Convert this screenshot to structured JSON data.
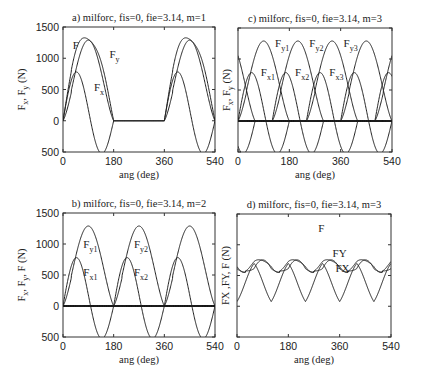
{
  "chart_data": [
    {
      "id": "a",
      "type": "line",
      "title": "a) milforc, fis=0, fie=3.14, m=1",
      "xlabel": "ang (deg)",
      "ylabel": "F_x, F_y (N)",
      "xlim": [
        0,
        540
      ],
      "ylim": [
        -500,
        1500
      ],
      "xticks": [
        0,
        180,
        360,
        540
      ],
      "yticks": [
        1500,
        1000,
        500,
        0,
        -500
      ],
      "ytick_labels": [
        "1500",
        "1000",
        "500",
        "0",
        "500"
      ],
      "show_yticklabels": true,
      "teeth": 1,
      "period_deg": 360,
      "engage_deg": 180,
      "annotations": [
        {
          "text": "F",
          "sub": "",
          "x": 35,
          "y": 1150
        },
        {
          "text": "F",
          "sub": "y",
          "x": 165,
          "y": 1000
        },
        {
          "text": "F",
          "sub": "x",
          "x": 110,
          "y": 480
        }
      ],
      "series": [
        {
          "name": "F",
          "peak": 1300,
          "peak_deg": 103
        },
        {
          "name": "Fy",
          "peak": 1290,
          "peak_deg": 108
        },
        {
          "name": "Fx",
          "peak": 830,
          "peak_deg": 53,
          "min": -470,
          "min_deg": 142
        }
      ]
    },
    {
      "id": "c",
      "type": "line",
      "title": "c) milforc, fis=0, fie=3.14, m=3",
      "xlabel": "ang (deg)",
      "ylabel": "F_x, F_y (N)",
      "xlim": [
        0,
        540
      ],
      "ylim": [
        -500,
        1500
      ],
      "xticks": [
        0,
        180,
        360,
        540
      ],
      "show_yticklabels": false,
      "teeth": 3,
      "period_deg": 120,
      "engage_deg": 180,
      "annotations": [
        {
          "text": "F",
          "sub": "y1",
          "x": 130,
          "y": 1200
        },
        {
          "text": "F",
          "sub": "y2",
          "x": 250,
          "y": 1200
        },
        {
          "text": "F",
          "sub": "y3",
          "x": 370,
          "y": 1200
        },
        {
          "text": "F",
          "sub": "x1",
          "x": 80,
          "y": 720
        },
        {
          "text": "F",
          "sub": "x2",
          "x": 200,
          "y": 720
        },
        {
          "text": "F",
          "sub": "x3",
          "x": 320,
          "y": 720
        }
      ],
      "series": [
        {
          "name": "Fy1",
          "peak": 1290,
          "peak_deg": 100
        },
        {
          "name": "Fx1",
          "peak": 830,
          "peak_deg": 53,
          "min": -470,
          "min_deg": 142
        }
      ]
    },
    {
      "id": "b",
      "type": "line",
      "title": "b) milforc, fis=0, fie=3.14, m=2",
      "xlabel": "ang (deg)",
      "ylabel": "F_x, F_y, F (N)",
      "xlim": [
        0,
        540
      ],
      "ylim": [
        -500,
        1500
      ],
      "xticks": [
        0,
        180,
        360,
        540
      ],
      "yticks": [
        1500,
        1000,
        500,
        0,
        -500
      ],
      "ytick_labels": [
        "1500",
        "1000",
        "500",
        "0",
        "500"
      ],
      "show_yticklabels": true,
      "teeth": 2,
      "period_deg": 180,
      "engage_deg": 180,
      "annotations": [
        {
          "text": "F",
          "sub": "y1",
          "x": 72,
          "y": 930
        },
        {
          "text": "F",
          "sub": "y2",
          "x": 252,
          "y": 930
        },
        {
          "text": "F",
          "sub": "x1",
          "x": 72,
          "y": 480
        },
        {
          "text": "F",
          "sub": "x2",
          "x": 252,
          "y": 480
        }
      ],
      "series": [
        {
          "name": "Fy1",
          "peak": 1270,
          "peak_deg": 100
        },
        {
          "name": "Fx1",
          "peak": 830,
          "peak_deg": 53,
          "min": -470,
          "min_deg": 142
        }
      ]
    },
    {
      "id": "d",
      "type": "line",
      "title": "d) milforc, fis=0, fie=3.14, m=3",
      "xlabel": "ang (deg)",
      "ylabel": "FX ,FY, F (N)",
      "xlim": [
        0,
        540
      ],
      "ylim": [
        -500,
        1500
      ],
      "xticks": [
        0,
        180,
        360,
        540
      ],
      "show_yticklabels": false,
      "teeth": 3,
      "period_deg": 120,
      "engage_deg": 180,
      "annotations": [
        {
          "text": "F",
          "sub": "",
          "x": 285,
          "y": 1200
        },
        {
          "text": "FY",
          "sub": "",
          "x": 335,
          "y": 800
        },
        {
          "text": "FX",
          "sub": "",
          "x": 345,
          "y": 560
        }
      ],
      "series": [
        {
          "name": "F",
          "max": 1300,
          "min": 620
        },
        {
          "name": "FY",
          "max": 1290,
          "min": 590
        },
        {
          "name": "FX",
          "max": 850,
          "min": -260
        }
      ]
    }
  ],
  "layout": {
    "panels": {
      "a": {
        "x0": 63,
        "x1": 215,
        "y_top": 27,
        "y_bot": 152
      },
      "c": {
        "x0": 238,
        "x1": 392,
        "y_top": 28,
        "y_bot": 152
      },
      "b": {
        "x0": 63,
        "x1": 215,
        "y_top": 213,
        "y_bot": 337
      },
      "d": {
        "x0": 237,
        "x1": 391,
        "y_top": 214,
        "y_bot": 337
      }
    }
  }
}
